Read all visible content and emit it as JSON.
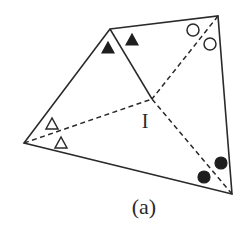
{
  "figure": {
    "caption": "(a)",
    "point_label": "I"
  },
  "vertices": {
    "top_left": {
      "x": 110,
      "y": 29
    },
    "top_right": {
      "x": 218,
      "y": 16
    },
    "bottom_right": {
      "x": 232,
      "y": 194
    },
    "left": {
      "x": 24,
      "y": 143
    }
  },
  "center": {
    "name": "I",
    "x": 152,
    "y": 99
  },
  "bisectors": [
    {
      "from": "top_left",
      "style": "solid"
    },
    {
      "from": "top_right",
      "style": "dashed"
    },
    {
      "from": "bottom_right",
      "style": "dashed"
    },
    {
      "from": "left",
      "style": "dashed"
    }
  ],
  "angle_markers": [
    {
      "vertex": "top_left",
      "shape": "triangle",
      "fill": "filled",
      "positions": [
        [
          108,
          48
        ],
        [
          132,
          40
        ]
      ]
    },
    {
      "vertex": "top_right",
      "shape": "circle",
      "fill": "open",
      "positions": [
        [
          193,
          30
        ],
        [
          210,
          44
        ]
      ]
    },
    {
      "vertex": "bottom_right",
      "shape": "circle",
      "fill": "filled",
      "positions": [
        [
          204,
          177
        ],
        [
          221,
          163
        ]
      ]
    },
    {
      "vertex": "left",
      "shape": "triangle",
      "fill": "open",
      "positions": [
        [
          52,
          124
        ],
        [
          61,
          143
        ]
      ]
    }
  ],
  "colors": {
    "line": "#2a2a2a",
    "fill_dark": "#1e1e1e",
    "background": "#ffffff"
  }
}
